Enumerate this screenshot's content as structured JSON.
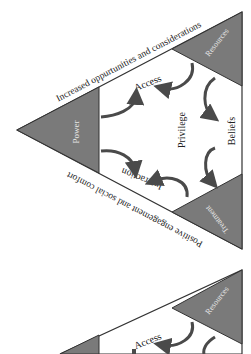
{
  "diagram": {
    "colors": {
      "corner_fill": "#7a7a7a",
      "outline": "#333333",
      "arrow": "#4a4a4a",
      "text": "#222222",
      "corner_text": "#e6e6e6"
    },
    "edges": {
      "top": "Increased oppurtunities and considerations",
      "bottom": "Positive engagement and social comfort"
    },
    "corners": {
      "left": "Power",
      "top_right": "Resources",
      "bottom_right": "Treatment"
    },
    "center": "Privilege",
    "sides": {
      "top": "Access",
      "right": "Beliefs",
      "bottom": "Interaction"
    },
    "second_copy": {
      "corners": {
        "top_right": "Resources"
      },
      "sides": {
        "top": "Access"
      }
    }
  }
}
